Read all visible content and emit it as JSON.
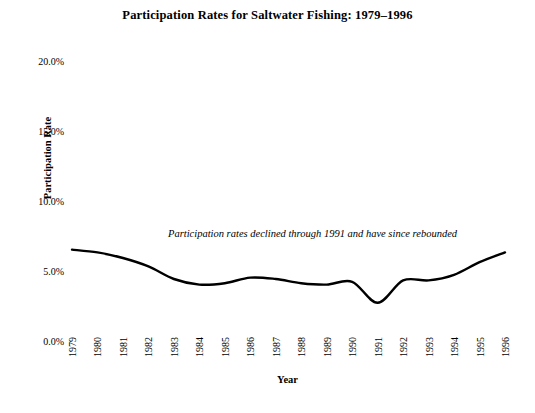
{
  "chart_data": {
    "type": "line",
    "title": "Participation Rates for Saltwater Fishing: 1979–1996",
    "xlabel": "Year",
    "ylabel": "Participation Rate",
    "categories": [
      "1979",
      "1980",
      "1981",
      "1982",
      "1983",
      "1984",
      "1985",
      "1986",
      "1987",
      "1988",
      "1989",
      "1990",
      "1991",
      "1992",
      "1993",
      "1994",
      "1995",
      "1996"
    ],
    "x": [
      1979,
      1980,
      1981,
      1982,
      1983,
      1984,
      1985,
      1986,
      1987,
      1988,
      1989,
      1990,
      1991,
      1992,
      1993,
      1994,
      1995,
      1996
    ],
    "values": [
      6.6,
      6.4,
      6.0,
      5.4,
      4.5,
      4.1,
      4.2,
      4.6,
      4.5,
      4.2,
      4.1,
      4.3,
      2.8,
      4.4,
      4.4,
      4.8,
      5.7,
      6.4
    ],
    "series": [
      {
        "name": "Participation Rate",
        "values": [
          6.6,
          6.4,
          6.0,
          5.4,
          4.5,
          4.1,
          4.2,
          4.6,
          4.5,
          4.2,
          4.1,
          4.3,
          2.8,
          4.4,
          4.4,
          4.8,
          5.7,
          6.4
        ]
      }
    ],
    "ytick_labels": [
      "20.0%",
      "15.0%",
      "10.0%",
      "5.0%",
      "0.0%"
    ],
    "ytick_values": [
      20,
      15,
      10,
      5,
      0
    ],
    "ylim": [
      0,
      20
    ],
    "xlim": [
      1979,
      1996
    ],
    "grid": false,
    "legend": false,
    "smoothing": "spline",
    "line_color": "#000000",
    "line_width": 2.4,
    "annotations": [
      {
        "text": "Participation rates declined through 1991 and have since rebounded",
        "style": "italic"
      }
    ]
  },
  "figure": {
    "background_color": "#ffffff"
  }
}
